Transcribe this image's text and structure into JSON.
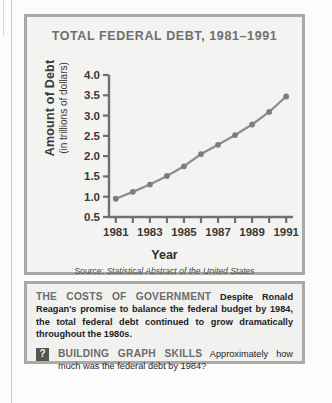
{
  "chart_data": {
    "type": "line",
    "title": "TOTAL FEDERAL DEBT, 1981–1991",
    "xlabel": "Year",
    "ylabel": "Amount of Debt",
    "ylabel_sub": "(in trillions of dollars)",
    "x": [
      1981,
      1982,
      1983,
      1984,
      1985,
      1986,
      1987,
      1988,
      1989,
      1990,
      1991
    ],
    "values": [
      0.95,
      1.12,
      1.3,
      1.51,
      1.75,
      2.05,
      2.28,
      2.52,
      2.78,
      3.09,
      3.47
    ],
    "xtick_labels": [
      "1981",
      "1983",
      "1985",
      "1987",
      "1989",
      "1991"
    ],
    "xtick_years": [
      1981,
      1983,
      1985,
      1987,
      1989,
      1991
    ],
    "ytick_labels": [
      "0.5",
      "1.0",
      "1.5",
      "2.0",
      "2.5",
      "3.0",
      "3.5",
      "4.0"
    ],
    "ytick_values": [
      0.5,
      1.0,
      1.5,
      2.0,
      2.5,
      3.0,
      3.5,
      4.0
    ],
    "xlim": [
      1980.6,
      1991.4
    ],
    "ylim": [
      0.5,
      4.0
    ],
    "grid": false,
    "legend": "none",
    "series_color": "#8e8e8c",
    "marker_color": "#7d7d7b"
  },
  "source": {
    "prefix": "Source:",
    "text": "Statistical Abstract of the United States"
  },
  "caption": {
    "heading": "THE COSTS OF GOVERNMENT",
    "body": "Despite Ronald Reagan's promise to balance the federal budget by 1984, the total federal debt continued to grow dramatically throughout the 1980s.",
    "question_badge": "?",
    "question_heading": "BUILDING GRAPH SKILLS",
    "question_body": "Approximately how much was the federal debt by 1984?"
  },
  "colors": {
    "panel_border": "#a9a9a7",
    "panel_bg": "#f3f3f2",
    "title_gray": "#6f6f6d",
    "axis": "#6f6f6d",
    "text": "#23231f"
  }
}
